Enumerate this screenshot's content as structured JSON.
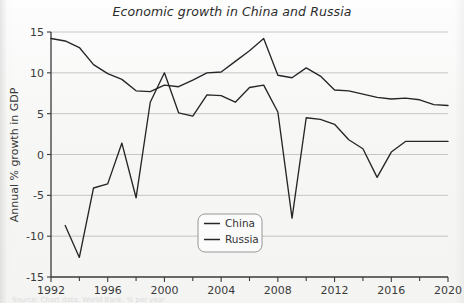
{
  "figure": {
    "title": "Economic growth in China and Russia",
    "caption_partial": "Source: Chart data, World Bank, % per year"
  },
  "legend": {
    "position": "center-bottom",
    "entries": [
      {
        "label": "China",
        "color": "#262626"
      },
      {
        "label": "Russia",
        "color": "#262626"
      }
    ]
  },
  "axes": {
    "ylabel": "Annual % growth in GDP",
    "xlabel": "",
    "yticks": [
      "15",
      "10",
      "5",
      "0",
      "-5",
      "-10",
      "-15"
    ],
    "xticks": [
      "1992",
      "1996",
      "2000",
      "2004",
      "2008",
      "2012",
      "2016",
      "2020"
    ],
    "xminor": [
      "1994",
      "1998",
      "2002",
      "2006",
      "2010",
      "2014",
      "2018"
    ],
    "grid": "horizontal"
  },
  "chart_data": {
    "type": "line",
    "title": "Economic growth in China and Russia",
    "xlabel": "",
    "ylabel": "Annual % growth in GDP",
    "xlim": [
      1992,
      2020
    ],
    "ylim": [
      -15,
      15
    ],
    "grid": true,
    "legend_position": "center-bottom",
    "x": [
      1992,
      1993,
      1994,
      1995,
      1996,
      1997,
      1998,
      1999,
      2000,
      2001,
      2002,
      2003,
      2004,
      2005,
      2006,
      2007,
      2008,
      2009,
      2010,
      2011,
      2012,
      2013,
      2014,
      2015,
      2016,
      2017,
      2018,
      2019,
      2020
    ],
    "series": [
      {
        "name": "China",
        "color": "#262626",
        "values": [
          14.2,
          13.9,
          13.1,
          11.0,
          9.9,
          9.2,
          7.8,
          7.7,
          8.5,
          8.3,
          9.1,
          10.0,
          10.1,
          11.4,
          12.7,
          14.2,
          9.7,
          9.4,
          10.6,
          9.6,
          7.9,
          7.8,
          7.4,
          7.0,
          6.8,
          6.9,
          6.7,
          6.1,
          6.0
        ]
      },
      {
        "name": "Russia",
        "color": "#262626",
        "values": [
          null,
          -8.7,
          -12.6,
          -4.1,
          -3.6,
          1.4,
          -5.3,
          6.4,
          10.0,
          5.1,
          4.7,
          7.3,
          7.2,
          6.4,
          8.2,
          8.5,
          5.2,
          -7.8,
          4.5,
          4.3,
          3.7,
          1.8,
          0.7,
          -2.8,
          0.3,
          1.6,
          1.6,
          1.6,
          1.6
        ]
      }
    ]
  }
}
